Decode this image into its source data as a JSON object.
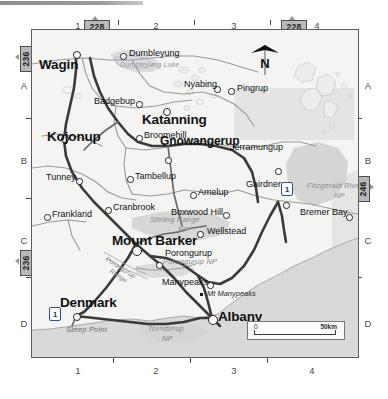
{
  "map": {
    "region": "Great Southern, Western Australia",
    "grid": {
      "columns": [
        "1",
        "2",
        "3",
        "4"
      ],
      "rows": [
        "A",
        "B",
        "C",
        "D"
      ]
    },
    "adjoining_sheets": [
      {
        "id": "sheet-top-left",
        "number": "228",
        "edge": "top"
      },
      {
        "id": "sheet-top-right",
        "number": "228",
        "edge": "top"
      },
      {
        "id": "sheet-left-upper",
        "number": "236",
        "edge": "left"
      },
      {
        "id": "sheet-left-lower",
        "number": "236",
        "edge": "left"
      },
      {
        "id": "sheet-right",
        "number": "246",
        "edge": "right"
      }
    ],
    "compass": {
      "label": "N"
    },
    "scale_bar": {
      "min": "0",
      "max": "50km"
    },
    "highway_shields": [
      {
        "label": "1",
        "near": "Jerramungup"
      },
      {
        "label": "1",
        "near": "Denmark"
      }
    ],
    "towns": [
      {
        "name": "Wagin",
        "class": "major"
      },
      {
        "name": "Dumbleyung",
        "class": "town"
      },
      {
        "name": "Nyabing",
        "class": "town"
      },
      {
        "name": "Pingrup",
        "class": "town"
      },
      {
        "name": "Badgebup",
        "class": "town"
      },
      {
        "name": "Katanning",
        "class": "major"
      },
      {
        "name": "Kojonup",
        "class": "major"
      },
      {
        "name": "Broomehill",
        "class": "town"
      },
      {
        "name": "Gnowangerup",
        "class": "major2"
      },
      {
        "name": "Jerramungup",
        "class": "town"
      },
      {
        "name": "Tunney",
        "class": "town"
      },
      {
        "name": "Tambellup",
        "class": "town"
      },
      {
        "name": "Amelup",
        "class": "town"
      },
      {
        "name": "Gairdner",
        "class": "town"
      },
      {
        "name": "Frankland",
        "class": "town"
      },
      {
        "name": "Cranbrook",
        "class": "town"
      },
      {
        "name": "Boxwood Hill",
        "class": "town"
      },
      {
        "name": "Bremer Bay",
        "class": "town"
      },
      {
        "name": "Mount Barker",
        "class": "major"
      },
      {
        "name": "Wellstead",
        "class": "town"
      },
      {
        "name": "Porongurup",
        "class": "town"
      },
      {
        "name": "Denmark",
        "class": "major"
      },
      {
        "name": "Manypeaks",
        "class": "town"
      },
      {
        "name": "Albany",
        "class": "major"
      }
    ],
    "features": [
      {
        "name": "Dumbleyung Lake",
        "type": "water"
      },
      {
        "name": "Fitzgerald River NP",
        "type": "park"
      },
      {
        "name": "Stirling Range NP",
        "type": "park"
      },
      {
        "name": "Porongurup NP",
        "type": "park"
      },
      {
        "name": "Porongurup Range",
        "type": "range"
      },
      {
        "name": "Torndirrup NP",
        "type": "park"
      },
      {
        "name": "Mt Manypeaks",
        "type": "peak"
      },
      {
        "name": "Steep Point",
        "type": "coast"
      }
    ],
    "labels": {
      "wagin": "Wagin",
      "dumbleyung": "Dumbleyung",
      "dumbleyung_lake": "Dumbleyung Lake",
      "nyabing": "Nyabing",
      "pingrup": "Pingrup",
      "badgebup": "Badgebup",
      "katanning": "Katanning",
      "kojonup": "Kojonup",
      "broomehill": "Broomehill",
      "gnowangerup": "Gnowangerup",
      "jerramungup": "Jerramungup",
      "tunney": "Tunney",
      "tambellup": "Tambellup",
      "amelup": "Amelup",
      "gairdner": "Gairdner",
      "frankland": "Frankland",
      "cranbrook": "Cranbrook",
      "boxwood_hill": "Boxwood Hill",
      "bremer_bay": "Bremer Bay",
      "mount_barker": "Mount Barker",
      "wellstead": "Wellstead",
      "porongurup": "Porongurup",
      "denmark": "Denmark",
      "manypeaks": "Manypeaks",
      "albany": "Albany",
      "fitzgerald_river_np": "Fitzgerald River",
      "fitzgerald_river_np2": "NP",
      "stirling_range_np": "Stirling Range",
      "stirling_range_np2": "NP",
      "porongurup_np": "Porongurup NP",
      "porongurup_range": "Porongurup",
      "porongurup_range2": "Range",
      "torndirrup_np": "Torndirrup",
      "torndirrup_np2": "NP",
      "mt_manypeaks": "Mt Manypeaks",
      "steep_point": "Steep Point"
    },
    "colors": {
      "land": "#f4f4f2",
      "sea": "#d9d9d9",
      "park": "#cfcfcf",
      "water": "#c5c8d2",
      "road_major": "#3a3a3a",
      "road_minor": "#8d8d8d",
      "neatline": "#5c5c5c",
      "shield": "#b9b9b9",
      "highway_blue": "#2b4f86"
    }
  }
}
